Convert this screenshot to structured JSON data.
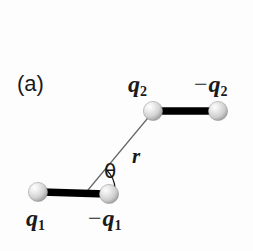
{
  "figure": {
    "panel_label": "(a)",
    "background_color": "#fdfdfd",
    "ink_color": "#1a1a1a",
    "rod_color": "#000000",
    "line_color": "#555555",
    "sphere_light": "#ffffff",
    "sphere_mid": "#d6d6d6",
    "sphere_dark": "#9b9b9b",
    "width": 253,
    "height": 251
  },
  "labels": {
    "q1": "q",
    "q1_sub": "1",
    "neg_q1_sign": "−",
    "neg_q1": "q",
    "neg_q1_sub": "1",
    "q2": "q",
    "q2_sub": "2",
    "neg_q2_sign": "−",
    "neg_q2": "q",
    "neg_q2_sub": "2",
    "separation": "r",
    "angle": "θ"
  },
  "geometry": {
    "dipole_lower": {
      "positive_sphere": {
        "cx": 38,
        "cy": 192,
        "r": 9.5
      },
      "negative_sphere": {
        "cx": 109,
        "cy": 194,
        "r": 9.5
      },
      "rod": {
        "x1": 44,
        "y1": 192,
        "x2": 104,
        "y2": 194,
        "width": 7
      }
    },
    "dipole_upper": {
      "positive_sphere": {
        "cx": 153,
        "cy": 111,
        "r": 9.5
      },
      "negative_sphere": {
        "cx": 218,
        "cy": 111,
        "r": 9.5
      },
      "rod": {
        "x1": 159,
        "y1": 111,
        "x2": 213,
        "y2": 111,
        "width": 7
      }
    },
    "separation_line": {
      "x1": 88,
      "y1": 190,
      "x2": 152,
      "y2": 113,
      "width": 1.1
    },
    "angle_arc": {
      "cx": 88,
      "cy": 190,
      "radius": 27,
      "start_deg": 0,
      "end_deg": 50
    }
  }
}
